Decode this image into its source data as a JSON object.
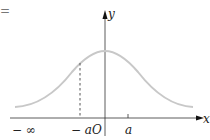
{
  "diagram": {
    "type": "normal-distribution-curve",
    "leading_symbol": "=",
    "axes": {
      "x_label": "x",
      "y_label": "y",
      "origin_label": "O"
    },
    "tick_labels": {
      "neg_infinity": "− ∞",
      "neg_a": "− a",
      "pos_a": "a"
    },
    "colors": {
      "curve": "#c8c8c8",
      "axis": "#333333",
      "dashed": "#555555"
    }
  }
}
